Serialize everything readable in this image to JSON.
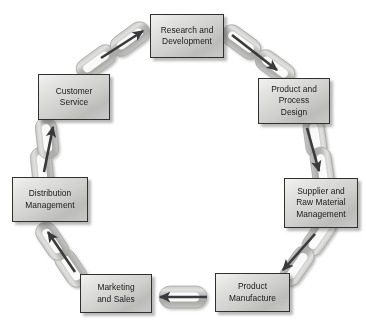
{
  "diagram": {
    "type": "cycle-diagram",
    "background_color": "#ffffff",
    "box_fill_light": "#f2f2f1",
    "box_fill_dark": "#bcbcba",
    "box_border_color": "#31302e",
    "chain_color": "#b9b9b7",
    "chain_highlight": "#d8d8d6",
    "arrow_color": "#3a3a3c",
    "flow_direction": "clockwise",
    "nodes": [
      {
        "id": "research-and-development",
        "label": "Research and\nDevelopment",
        "x": 150,
        "y": 14,
        "w": 74,
        "h": 44
      },
      {
        "id": "product-and-process-design",
        "label": "Product and\nProcess\nDesign",
        "x": 258,
        "y": 78,
        "w": 72,
        "h": 46
      },
      {
        "id": "supplier-and-raw-material-management",
        "label": "Supplier and\nRaw Material\nManagement",
        "x": 284,
        "y": 178,
        "w": 74,
        "h": 50
      },
      {
        "id": "product-manufacture",
        "label": "Product\nManufacture",
        "x": 215,
        "y": 273,
        "w": 75,
        "h": 39
      },
      {
        "id": "marketing-and-sales",
        "label": "Marketing\nand Sales",
        "x": 80,
        "y": 274,
        "w": 72,
        "h": 39
      },
      {
        "id": "distribution-management",
        "label": "Distribution\nManagement",
        "x": 12,
        "y": 177,
        "w": 76,
        "h": 45
      },
      {
        "id": "customer-service",
        "label": "Customer\nService",
        "x": 38,
        "y": 74,
        "w": 72,
        "h": 46
      }
    ],
    "nodes_extra": [
      {
        "id": "customer-service-2",
        "label": "Customer\nService"
      }
    ],
    "connectors": [
      {
        "id": "connector-rd-to-design",
        "from": "research-and-development",
        "to": "product-and-process-design",
        "arrow": "forward"
      },
      {
        "id": "connector-design-to-supplier",
        "from": "product-and-process-design",
        "to": "supplier-and-raw-material-management",
        "arrow": "forward"
      },
      {
        "id": "connector-supplier-to-manufacture",
        "from": "supplier-and-raw-material-management",
        "to": "product-manufacture",
        "arrow": "forward"
      },
      {
        "id": "connector-manufacture-to-marketing",
        "from": "product-manufacture",
        "to": "marketing-and-sales",
        "arrow": "forward"
      },
      {
        "id": "connector-marketing-to-distribution",
        "from": "marketing-and-sales",
        "to": "distribution-management",
        "arrow": "forward"
      },
      {
        "id": "connector-distribution-to-customer",
        "from": "distribution-management",
        "to": "customer-service",
        "arrow": "forward"
      },
      {
        "id": "connector-customer-to-rd",
        "from": "customer-service",
        "to": "research-and-development",
        "arrow": "forward"
      }
    ]
  }
}
